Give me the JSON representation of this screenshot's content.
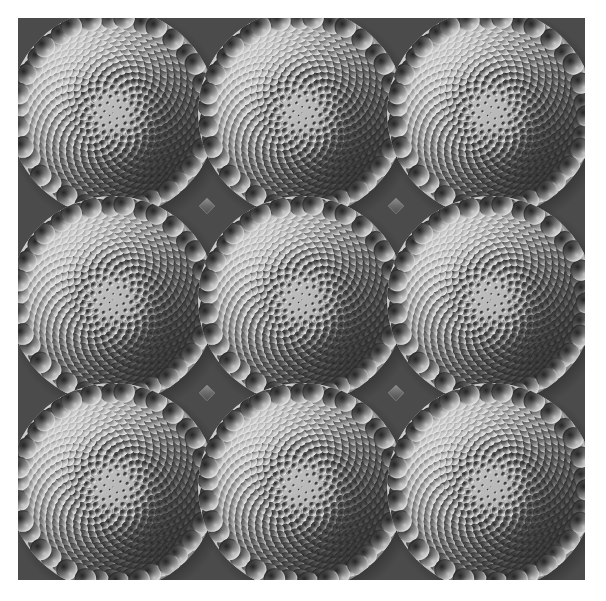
{
  "artwork": {
    "title": "Phyllotaxis Sphere Tiling",
    "medium": "procedural 3d shaded render",
    "canvas": {
      "x": 18,
      "y": 18,
      "width": 567,
      "height": 562,
      "background_color": "#4b4b4b"
    },
    "page_background_color": "#ffffff"
  },
  "palette": {
    "page_background": "#ffffff",
    "canvas_background": "#4b4b4b",
    "plate_base": "#b9b9b9",
    "plate_rim_light": "#e2e2e2",
    "plate_shadow": "#5c5c5c",
    "sphere_highlight": "#f2f2f2",
    "sphere_midtone": "#a8a8a8",
    "sphere_shadow": "#2a2a2a",
    "stem_line": "#6f6f6f",
    "junction_diamond": "#6a6a6a"
  },
  "chart_data": {
    "type": "scatter",
    "xlabel": "",
    "ylabel": "",
    "grid": false,
    "legend_position": "none",
    "xlim": [
      0,
      567
    ],
    "ylim": [
      0,
      562
    ],
    "tiling": {
      "rows": 3,
      "columns": 3,
      "disc_count": 9,
      "disc_radius": 104,
      "spacing_x": 189,
      "spacing_y": 187,
      "first_center_x": 95,
      "first_center_y": 95
    },
    "spiral": {
      "point_count": 620,
      "divergence_angle_deg": 137.508,
      "radial_scale": 4.18,
      "sphere_radius_min": 0.55,
      "sphere_radius_max": 11.6,
      "sphere_radius_exponent": 1.02,
      "stem_threshold_radius": 0.62
    },
    "lighting": {
      "azimuth_deg": 315,
      "elevation_deg": 52,
      "specular_strength": 0.85,
      "ambient": 0.22
    },
    "disc_centers": [
      {
        "index": 1,
        "row": 1,
        "col": 1,
        "cx": 95,
        "cy": 95
      },
      {
        "index": 2,
        "row": 1,
        "col": 2,
        "cx": 284,
        "cy": 95
      },
      {
        "index": 3,
        "row": 1,
        "col": 3,
        "cx": 473,
        "cy": 95
      },
      {
        "index": 4,
        "row": 2,
        "col": 1,
        "cx": 95,
        "cy": 282
      },
      {
        "index": 5,
        "row": 2,
        "col": 2,
        "cx": 284,
        "cy": 282
      },
      {
        "index": 6,
        "row": 2,
        "col": 3,
        "cx": 473,
        "cy": 282
      },
      {
        "index": 7,
        "row": 3,
        "col": 1,
        "cx": 95,
        "cy": 469
      },
      {
        "index": 8,
        "row": 3,
        "col": 2,
        "cx": 284,
        "cy": 469
      },
      {
        "index": 9,
        "row": 3,
        "col": 3,
        "cx": 473,
        "cy": 469
      }
    ],
    "junction_markers": [
      {
        "x": 189,
        "y": 188,
        "size": 11
      },
      {
        "x": 378,
        "y": 188,
        "size": 11
      },
      {
        "x": 189,
        "y": 375,
        "size": 11
      },
      {
        "x": 378,
        "y": 375,
        "size": 11
      }
    ]
  }
}
